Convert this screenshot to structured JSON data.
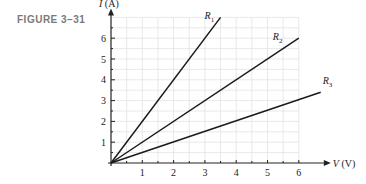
{
  "figure_label": "FIGURE 3–31",
  "chart_data": {
    "type": "line",
    "title": "",
    "xlabel": "V (V)",
    "ylabel": "I (A)",
    "xlim": [
      0,
      6.8
    ],
    "ylim": [
      0,
      7
    ],
    "x_ticks": [
      "1",
      "2",
      "3",
      "4",
      "5",
      "6"
    ],
    "y_ticks": [
      "1",
      "2",
      "3",
      "4",
      "5",
      "6"
    ],
    "grid": true,
    "series": [
      {
        "name": "R1",
        "x": [
          0,
          3.5
        ],
        "y": [
          0,
          7
        ]
      },
      {
        "name": "R2",
        "x": [
          0,
          6
        ],
        "y": [
          0,
          6
        ]
      },
      {
        "name": "R3",
        "x": [
          0,
          6.7
        ],
        "y": [
          0,
          3.4
        ]
      }
    ]
  }
}
